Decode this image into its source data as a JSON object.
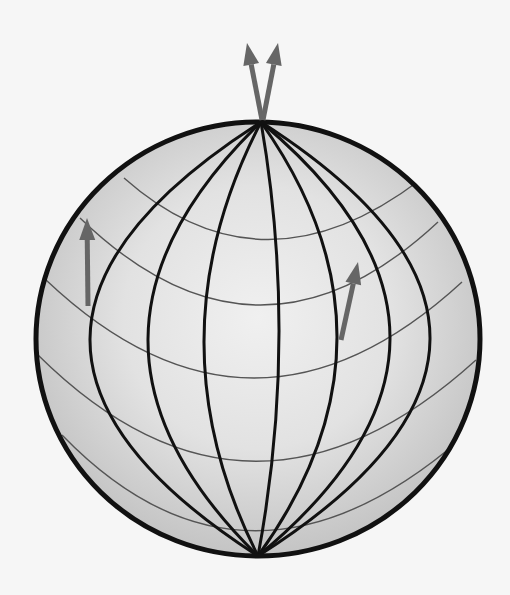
{
  "diagram": {
    "colors": {
      "background": "#f6f6f6",
      "globe_center": "#f0f0f0",
      "globe_edge": "#c4c4c4",
      "outline": "#111111",
      "meridian": "#111111",
      "parallel": "#555555",
      "arrow": "#666666"
    },
    "meridian_count": 7,
    "parallel_count": 5,
    "arrows": [
      {
        "name": "north-pole-arrow-left",
        "location": "north pole",
        "direction": "up-left"
      },
      {
        "name": "north-pole-arrow-right",
        "location": "north pole",
        "direction": "up-right"
      },
      {
        "name": "west-arrow",
        "location": "western mid-latitude",
        "direction": "up"
      },
      {
        "name": "east-arrow",
        "location": "eastern mid-latitude",
        "direction": "up-right"
      }
    ]
  }
}
